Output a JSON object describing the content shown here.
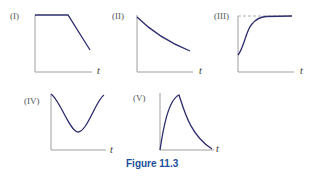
{
  "figure": {
    "caption": "Figure 11.3",
    "axis_variable": "t",
    "colors": {
      "curve": "#2d2d6e",
      "axis": "#999999",
      "caption": "#1a4f9c"
    },
    "panels": [
      {
        "id": "I",
        "label": "(I)",
        "shape": "constant then linear decrease"
      },
      {
        "id": "II",
        "label": "(II)",
        "shape": "decreasing concave-up decay"
      },
      {
        "id": "III",
        "label": "(III)",
        "shape": "sigmoid rise to dashed asymptote"
      },
      {
        "id": "IV",
        "label": "(IV)",
        "shape": "cosine-like dip and rise"
      },
      {
        "id": "V",
        "label": "(V)",
        "shape": "sharp rise to peak then decay"
      }
    ]
  }
}
